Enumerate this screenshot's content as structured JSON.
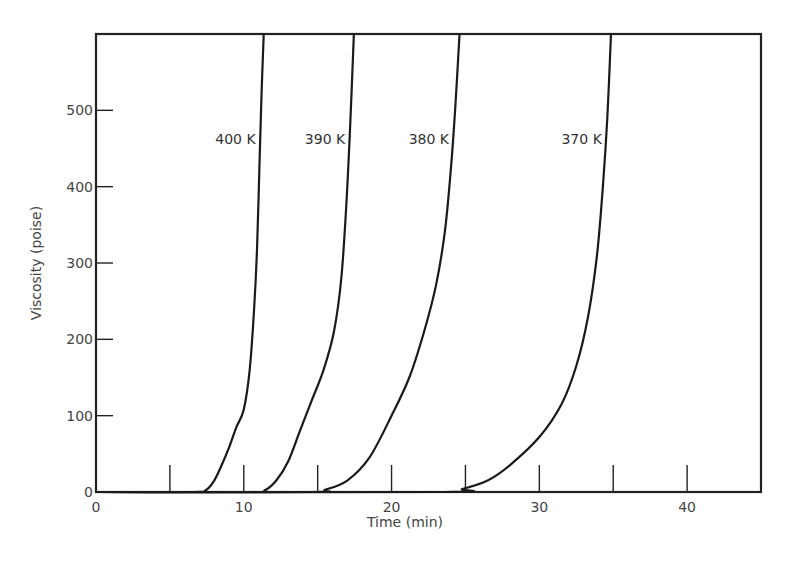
{
  "chart_data": {
    "type": "line",
    "title": "",
    "xlabel": "Time (min)",
    "ylabel": "Viscosity (poise)",
    "xlim": [
      0,
      45
    ],
    "ylim": [
      0,
      600
    ],
    "grid": false,
    "x_ticks": [
      0,
      10,
      20,
      30,
      40
    ],
    "x_tick_labels": [
      "0",
      "10",
      "20",
      "30",
      "40"
    ],
    "x_minor_ticks": [
      5,
      10,
      15,
      20,
      25,
      30,
      35,
      40
    ],
    "y_ticks": [
      0,
      100,
      200,
      300,
      400,
      500
    ],
    "y_tick_labels": [
      "0",
      "100",
      "200",
      "300",
      "400",
      "500"
    ],
    "series": [
      {
        "name": "400 K",
        "label_at": [
          0,
          0
        ],
        "points": [
          [
            0,
            0
          ],
          [
            6.5,
            0
          ],
          [
            7.4,
            2
          ],
          [
            8.0,
            15
          ],
          [
            8.5,
            35
          ],
          [
            9.0,
            58
          ],
          [
            9.5,
            85
          ],
          [
            10.0,
            108
          ],
          [
            10.4,
            160
          ],
          [
            10.7,
            240
          ],
          [
            10.9,
            320
          ],
          [
            11.05,
            420
          ],
          [
            11.2,
            520
          ],
          [
            11.35,
            600
          ]
        ]
      },
      {
        "name": "390 K",
        "label_at": [
          0,
          0
        ],
        "points": [
          [
            0,
            0
          ],
          [
            10.5,
            0
          ],
          [
            11.4,
            2
          ],
          [
            12.2,
            15
          ],
          [
            13.0,
            40
          ],
          [
            13.8,
            80
          ],
          [
            14.6,
            120
          ],
          [
            15.4,
            160
          ],
          [
            16.1,
            210
          ],
          [
            16.6,
            280
          ],
          [
            16.95,
            380
          ],
          [
            17.2,
            480
          ],
          [
            17.45,
            600
          ]
        ]
      },
      {
        "name": "380 K",
        "label_at": [
          0,
          0
        ],
        "points": [
          [
            0,
            0
          ],
          [
            14.5,
            0
          ],
          [
            15.5,
            3
          ],
          [
            17.0,
            15
          ],
          [
            18.5,
            45
          ],
          [
            20.0,
            100
          ],
          [
            21.2,
            150
          ],
          [
            22.2,
            210
          ],
          [
            23.0,
            270
          ],
          [
            23.6,
            340
          ],
          [
            24.0,
            420
          ],
          [
            24.3,
            500
          ],
          [
            24.6,
            600
          ]
        ]
      },
      {
        "name": "370 K",
        "label_at": [
          0,
          0
        ],
        "points": [
          [
            0,
            0
          ],
          [
            23.5,
            0
          ],
          [
            24.8,
            4
          ],
          [
            26.5,
            15
          ],
          [
            28.0,
            35
          ],
          [
            30.0,
            72
          ],
          [
            31.5,
            115
          ],
          [
            32.5,
            165
          ],
          [
            33.3,
            230
          ],
          [
            33.9,
            310
          ],
          [
            34.3,
            400
          ],
          [
            34.6,
            490
          ],
          [
            34.85,
            600
          ]
        ]
      }
    ],
    "annotations": [
      "400 K",
      "390 K",
      "380 K",
      "370 K"
    ]
  }
}
